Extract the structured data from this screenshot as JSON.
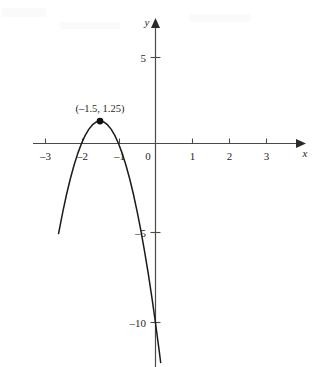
{
  "chart_data": {
    "type": "line",
    "title": "",
    "subtitle": "",
    "xlabel": "x",
    "ylabel": "y",
    "grid": false,
    "legend": false,
    "legend_position": "none",
    "xlim": [
      -3.3,
      3.4
    ],
    "ylim": [
      -12.4,
      6.2
    ],
    "xticks": [
      -3,
      -2,
      -1,
      0,
      1,
      2,
      3
    ],
    "xticklabels": [
      "–3",
      "–2",
      "–1",
      "0",
      "1",
      "2",
      "3"
    ],
    "yticks": [
      5,
      -5,
      -10
    ],
    "yticklabels": [
      "5",
      "–5",
      "–10"
    ],
    "series": [
      {
        "name": "parabola",
        "equation": "y = –5(x + 1.5)² + 1.25",
        "color": "#1a1a1a",
        "vertex": {
          "x": -1.5,
          "y": 1.25
        },
        "roots": [
          -2,
          -1
        ],
        "y_intercept": -10,
        "opens": "down",
        "x": [
          -2.62,
          -2.5,
          -2.4,
          -2.3,
          -2.2,
          -2.1,
          -2.0,
          -1.9,
          -1.8,
          -1.7,
          -1.6,
          -1.5,
          -1.4,
          -1.3,
          -1.2,
          -1.1,
          -1.0,
          -0.9,
          -0.8,
          -0.7,
          -0.6,
          -0.5,
          -0.4,
          -0.3,
          -0.2,
          -0.1,
          0.0,
          0.1,
          0.14
        ],
        "values": [
          -5.02,
          -3.75,
          -2.8,
          -1.95,
          -1.2,
          -0.55,
          0.0,
          0.45,
          0.8,
          1.05,
          1.2,
          1.25,
          1.2,
          1.05,
          0.8,
          0.45,
          0.0,
          -0.55,
          -1.2,
          -1.95,
          -2.8,
          -3.75,
          -4.8,
          -5.95,
          -7.2,
          -8.55,
          -10.0,
          -11.55,
          -12.2
        ]
      }
    ],
    "annotations": [
      {
        "name": "vertex-label",
        "text": "(–1.5, 1.25)",
        "x": -1.5,
        "y": 1.25,
        "marker": "filled-circle"
      }
    ]
  },
  "axes": {
    "x_axis_name": "x",
    "y_axis_name": "y",
    "origin_label": "0"
  }
}
